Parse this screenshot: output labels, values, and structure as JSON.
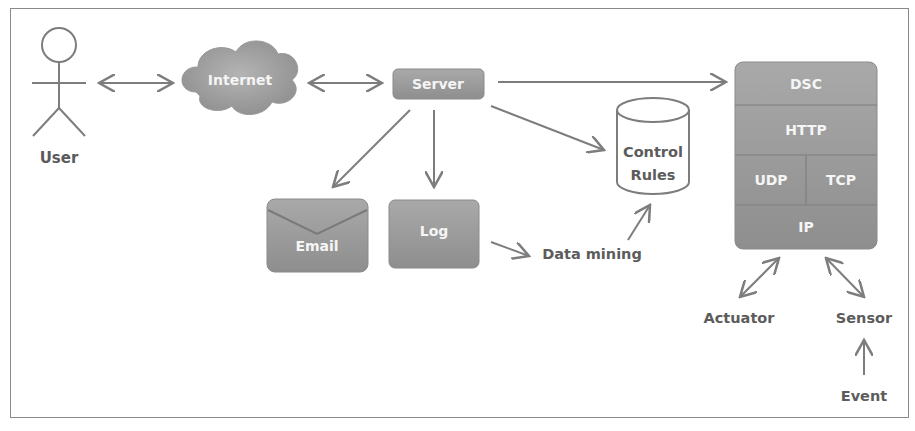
{
  "diagram": {
    "nodes": {
      "user": {
        "label": "User"
      },
      "internet": {
        "label": "Internet"
      },
      "server": {
        "label": "Server"
      },
      "email": {
        "label": "Email"
      },
      "log": {
        "label": "Log"
      },
      "data_mining": {
        "label": "Data mining"
      },
      "control_rules": {
        "line1": "Control",
        "line2": "Rules"
      },
      "dsc_stack": {
        "dsc": "DSC",
        "http": "HTTP",
        "udp": "UDP",
        "tcp": "TCP",
        "ip": "IP"
      },
      "actuator": {
        "label": "Actuator"
      },
      "sensor": {
        "label": "Sensor"
      },
      "event": {
        "label": "Event"
      }
    },
    "edges": [
      {
        "from": "User",
        "to": "Internet",
        "type": "bidirectional"
      },
      {
        "from": "Internet",
        "to": "Server",
        "type": "bidirectional"
      },
      {
        "from": "Server",
        "to": "DSC",
        "type": "directed"
      },
      {
        "from": "Server",
        "to": "Email",
        "type": "directed"
      },
      {
        "from": "Server",
        "to": "Log",
        "type": "directed"
      },
      {
        "from": "Server",
        "to": "Control Rules",
        "type": "directed"
      },
      {
        "from": "Log",
        "to": "Data mining",
        "type": "directed"
      },
      {
        "from": "Data mining",
        "to": "Control Rules",
        "type": "directed"
      },
      {
        "from": "IP",
        "to": "Actuator",
        "type": "bidirectional"
      },
      {
        "from": "IP",
        "to": "Sensor",
        "type": "bidirectional"
      },
      {
        "from": "Event",
        "to": "Sensor",
        "type": "directed"
      }
    ],
    "colors": {
      "node_fill": "#9e9e9e",
      "node_fill_dark": "#8c8c8c",
      "line": "#7d7d7d",
      "text_dark": "#5a5a5a",
      "text_light": "#f5f5f5"
    }
  }
}
